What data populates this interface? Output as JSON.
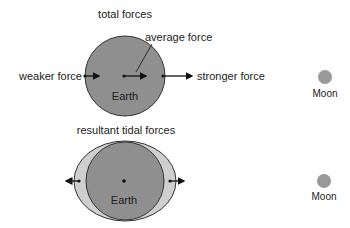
{
  "top": {
    "title": "total forces",
    "average_label": "average force",
    "weaker_label": "weaker force",
    "stronger_label": "stronger force",
    "earth_label": "Earth",
    "moon_label": "Moon"
  },
  "bottom": {
    "title": "resultant tidal forces",
    "earth_label": "Earth",
    "moon_label": "Moon"
  },
  "colors": {
    "earth": "#8f8f8f",
    "bulge": "#cfcfcf",
    "moon": "#9a9a9a",
    "outline": "#333333",
    "arrow": "#111111"
  }
}
